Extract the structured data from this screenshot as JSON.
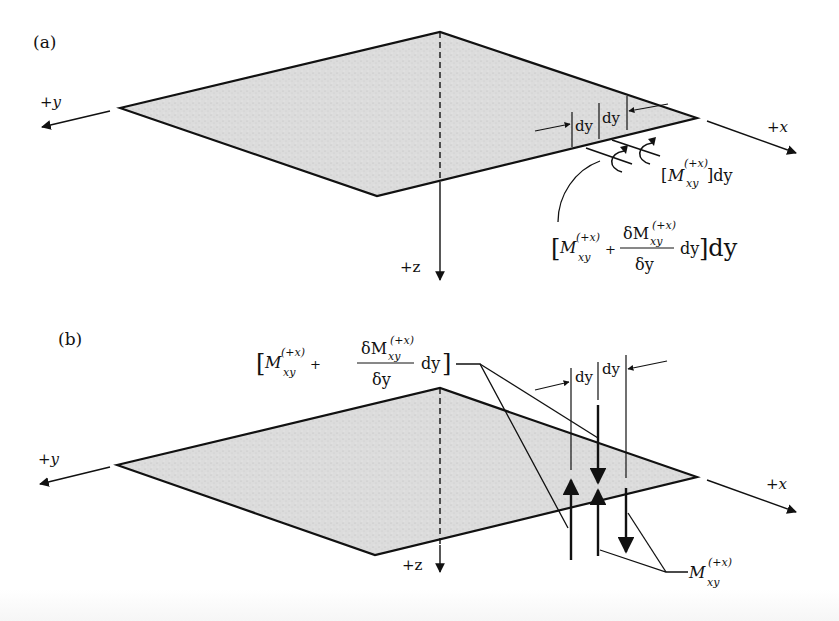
{
  "figure": {
    "panel_a": {
      "label": "(a)",
      "axes": {
        "x": "+x",
        "y": "+y",
        "z": "+z"
      },
      "dimension_labels": [
        "dy",
        "dy"
      ],
      "moment_label_1": {
        "prefix": "[",
        "symbol": "M",
        "superscript": "(+x)",
        "subscript": "xy",
        "suffix": "]dy"
      },
      "moment_label_2": {
        "open": "[",
        "symbol": "M",
        "superscript": "(+x)",
        "subscript": "xy",
        "plus": "+",
        "frac_num_prefix": "δM",
        "frac_num_sub": "xy",
        "frac_num_sup": "(+x)",
        "frac_den": "δy",
        "tail": "dy",
        "close": "]dy"
      }
    },
    "panel_b": {
      "label": "(b)",
      "axes": {
        "x": "+x",
        "y": "+y",
        "z": "+z"
      },
      "dimension_labels": [
        "dy",
        "dy"
      ],
      "moment_label_top": {
        "open": "[",
        "symbol": "M",
        "superscript": "(+x)",
        "subscript": "xy",
        "plus": "+",
        "frac_num_prefix": "δM",
        "frac_num_sub": "xy",
        "frac_num_sup": "(+x)",
        "frac_den": "δy",
        "tail": "dy",
        "close": "]"
      },
      "moment_label_bottom": {
        "symbol": "M",
        "superscript": "(+x)",
        "subscript": "xy"
      }
    },
    "colors": {
      "plate_fill": "#d9d9d9",
      "stroke": "#111111",
      "background": "#ffffff"
    }
  }
}
